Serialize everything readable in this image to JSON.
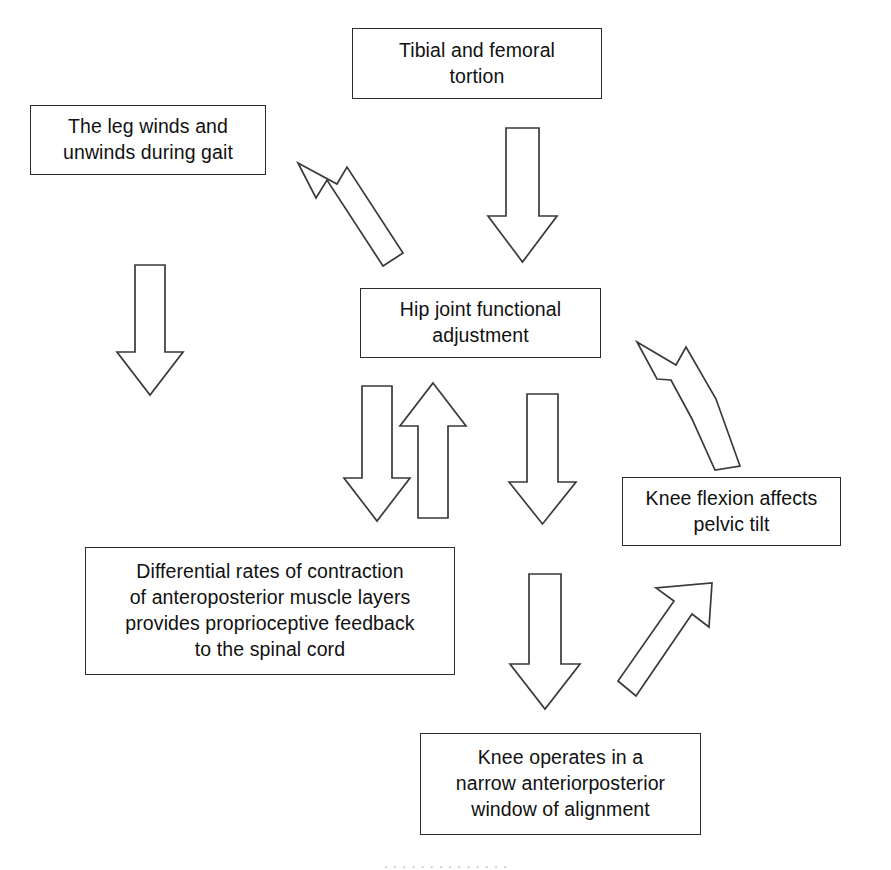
{
  "diagram": {
    "type": "flowchart",
    "background_color": "#ffffff",
    "line_color": "#3a3a3a",
    "text_color": "#111111",
    "nodes": [
      {
        "id": "tibial-femoral-tortion",
        "label": "Tibial and femoral\ntortion",
        "x": 352,
        "y": 28,
        "width": 250,
        "height": 71
      },
      {
        "id": "leg-winds-unwinds",
        "label": "The leg winds and\nunwinds during gait",
        "x": 30,
        "y": 105,
        "width": 236,
        "height": 70
      },
      {
        "id": "hip-joint-adjustment",
        "label": "Hip joint functional\nadjustment",
        "x": 360,
        "y": 288,
        "width": 241,
        "height": 70
      },
      {
        "id": "differential-rates",
        "label": "Differential rates of contraction\nof anteroposterior muscle layers\nprovides proprioceptive feedback\nto the spinal cord",
        "x": 85,
        "y": 547,
        "width": 370,
        "height": 128
      },
      {
        "id": "knee-flexion-pelvic-tilt",
        "label": "Knee flexion affects\npelvic tilt",
        "x": 622,
        "y": 477,
        "width": 219,
        "height": 69
      },
      {
        "id": "knee-window-alignment",
        "label": "Knee operates in a\nnarrow anteriorposterior\nwindow of alignment",
        "x": 420,
        "y": 733,
        "width": 281,
        "height": 102
      }
    ],
    "arrows": [
      {
        "id": "tortion-to-hip",
        "name": "arrow-down-tortion-to-hip",
        "direction": "down",
        "from": "tibial-femoral-tortion",
        "to": "hip-joint-adjustment"
      },
      {
        "id": "hip-to-leg-winds",
        "name": "arrow-diagonal-up-left-to-leg-winds",
        "direction": "up-left",
        "from": "hip-joint-adjustment",
        "to": "leg-winds-unwinds"
      },
      {
        "id": "leg-winds-down",
        "name": "arrow-down-from-leg-winds",
        "direction": "down",
        "from": "leg-winds-unwinds",
        "to": "differential-rates"
      },
      {
        "id": "hip-to-differential",
        "name": "arrow-down-hip-to-differential",
        "direction": "down",
        "from": "hip-joint-adjustment",
        "to": "differential-rates"
      },
      {
        "id": "differential-to-hip",
        "name": "arrow-up-differential-to-hip",
        "direction": "up",
        "from": "differential-rates",
        "to": "hip-joint-adjustment"
      },
      {
        "id": "hip-down-middle",
        "name": "arrow-down-hip-middle",
        "direction": "down",
        "from": "hip-joint-adjustment",
        "to": "knee-window-alignment"
      },
      {
        "id": "middle-down-to-knee-window",
        "name": "arrow-down-to-knee-window",
        "direction": "down",
        "from": "hip-joint-adjustment",
        "to": "knee-window-alignment"
      },
      {
        "id": "knee-flexion-to-hip",
        "name": "arrow-diagonal-up-left-knee-flexion-to-hip",
        "direction": "up-left",
        "from": "knee-flexion-pelvic-tilt",
        "to": "hip-joint-adjustment"
      },
      {
        "id": "knee-window-to-knee-flexion",
        "name": "arrow-diagonal-up-right-knee-window-to-flexion",
        "direction": "up-right",
        "from": "knee-window-alignment",
        "to": "knee-flexion-pelvic-tilt"
      }
    ]
  },
  "caption": {
    "text": "· · · · · · · · · · · · · ·"
  }
}
